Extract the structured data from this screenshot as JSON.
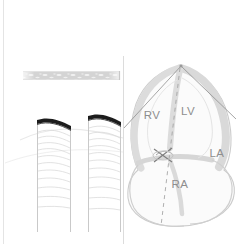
{
  "figure": {
    "background_color": "#ffffff",
    "width": 249,
    "height": 244
  },
  "palette": {
    "outline_gray": "#c9c9c9",
    "wall_fill_gray": "#d8d8d8",
    "label_gray": "#8e8e8e",
    "dark_flap": "#1a1a1a",
    "faint_line": "#e2e2e2",
    "sector_line": "#9a9a9a",
    "speckle_band": "#cfcfcf",
    "divider": "#dcdcdc"
  },
  "left_panel": {
    "name": "vessel-panel",
    "divider_x": 123,
    "border_left_x": 3,
    "speckle_band": {
      "name": "tissue-band",
      "x": 23,
      "y": 71,
      "width": 97,
      "height": 9
    },
    "vessels": [
      {
        "name": "vessel-left",
        "left_wall_x": 37,
        "right_wall_x": 70,
        "top_y": 117,
        "bottom_y": 232,
        "flap_label": "intimal-flap",
        "striation_count": 11
      },
      {
        "name": "vessel-right",
        "left_wall_x": 88,
        "right_wall_x": 120,
        "top_y": 113,
        "bottom_y": 232,
        "flap_label": "intimal-flap",
        "striation_count": 11
      }
    ]
  },
  "heart_panel": {
    "name": "heart-diagram",
    "apex": {
      "x": 181,
      "y": 65
    },
    "sector": {
      "name": "ultrasound-sector",
      "left_end": {
        "x": 124,
        "y": 128
      },
      "right_end": {
        "x": 236,
        "y": 119
      },
      "center_axis_end": {
        "x": 161,
        "y": 226
      }
    },
    "valve_marker": {
      "name": "av-valve-marker",
      "x": 163,
      "y": 155
    },
    "chambers": [
      {
        "id": "rv",
        "label": "RV",
        "name": "label-right-ventricle",
        "x": 152,
        "y": 119
      },
      {
        "id": "lv",
        "label": "LV",
        "name": "label-left-ventricle",
        "x": 188,
        "y": 115
      },
      {
        "id": "la",
        "label": "LA",
        "name": "label-left-atrium",
        "x": 217,
        "y": 157
      },
      {
        "id": "ra",
        "label": "RA",
        "name": "label-right-atrium",
        "x": 180,
        "y": 188
      }
    ]
  }
}
